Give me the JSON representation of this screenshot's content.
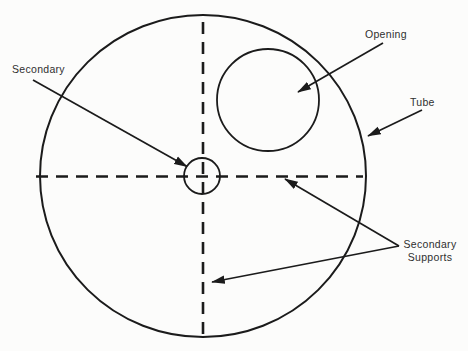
{
  "diagram": {
    "labels": {
      "secondary": "Secondary",
      "opening": "Opening",
      "tube": "Tube",
      "supports_line1": "Secondary",
      "supports_line2": "Supports"
    },
    "colors": {
      "line": "#1b1b1b",
      "text": "#2f2f2f",
      "background": "#fcfcfb"
    },
    "callouts": [
      {
        "label": "Secondary",
        "arrow_count": 1,
        "points_to": "small circle at center of tube"
      },
      {
        "label": "Opening",
        "arrow_count": 1,
        "points_to": "circle in upper-right of tube"
      },
      {
        "label": "Tube",
        "arrow_count": 1,
        "points_to": "outer circle edge"
      },
      {
        "label": "Secondary Supports",
        "arrow_count": 2,
        "points_to": "dashed crosshair lines"
      }
    ]
  }
}
